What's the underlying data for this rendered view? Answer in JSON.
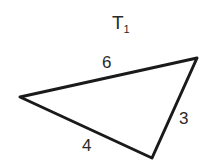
{
  "diagram": {
    "title": "T",
    "title_subscript": "1",
    "triangle": {
      "vertices": [
        [
          20,
          97
        ],
        [
          197,
          58
        ],
        [
          152,
          158
        ]
      ],
      "stroke_color": "#1a1a1a"
    },
    "side_labels": [
      {
        "text": "6",
        "side": "top"
      },
      {
        "text": "3",
        "side": "right"
      },
      {
        "text": "4",
        "side": "bottom"
      }
    ]
  }
}
